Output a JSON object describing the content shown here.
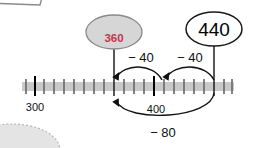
{
  "diagram": {
    "type": "number-line",
    "axis": {
      "start_label": "300",
      "mid_label": "400",
      "major_ticks": [
        "300",
        "400"
      ],
      "minor_tick_count": 20,
      "bar_color": "#c9c9c9",
      "tick_color": "#6e6e6e",
      "major_tick_color": "#000000"
    },
    "bubbles": [
      {
        "id": "answer-bubble",
        "value": "360",
        "fill": "#d6d6d6",
        "stroke": "#8a8a8a",
        "text_color": "#c0374a"
      },
      {
        "id": "start-bubble",
        "value": "440",
        "fill": "#ffffff",
        "stroke": "#1a1a1a",
        "text_color": "#000000"
      }
    ],
    "jumps": [
      {
        "id": "jump-left",
        "label": "− 40",
        "position": "above"
      },
      {
        "id": "jump-right",
        "label": "− 40",
        "position": "above"
      },
      {
        "id": "jump-total",
        "label": "− 80",
        "position": "below"
      }
    ],
    "axis_labels": [
      {
        "id": "tick-label-300",
        "text": "300"
      },
      {
        "id": "tick-label-400",
        "text": "400"
      }
    ]
  }
}
